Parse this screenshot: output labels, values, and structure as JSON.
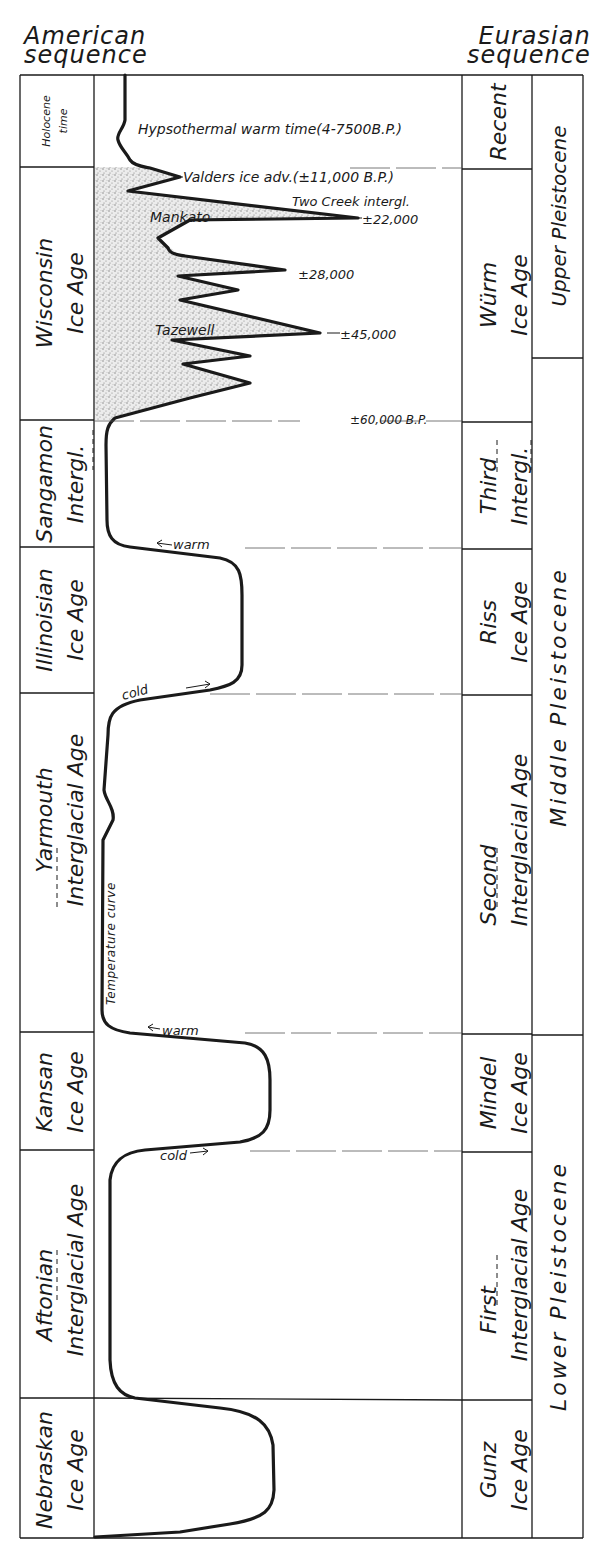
{
  "headers": {
    "american": [
      "American",
      "sequence"
    ],
    "eurasian": [
      "Eurasian",
      "sequence"
    ]
  },
  "american_sequence": [
    {
      "lines": [
        "Holocene",
        "time"
      ],
      "y_top": 75,
      "y_bottom": 167,
      "type": "holocene"
    },
    {
      "lines": [
        "Wisconsin",
        "Ice Age"
      ],
      "y_top": 167,
      "y_bottom": 420,
      "type": "glacial"
    },
    {
      "lines": [
        "Sangamon",
        "Intergl."
      ],
      "y_top": 420,
      "y_bottom": 547,
      "type": "interglacial"
    },
    {
      "lines": [
        "Illinoisian",
        "Ice Age"
      ],
      "y_top": 547,
      "y_bottom": 693,
      "type": "glacial"
    },
    {
      "lines": [
        "Yarmouth",
        "Interglacial Age"
      ],
      "y_top": 693,
      "y_bottom": 1032,
      "type": "interglacial"
    },
    {
      "lines": [
        "Kansan",
        "Ice Age"
      ],
      "y_top": 1032,
      "y_bottom": 1150,
      "type": "glacial"
    },
    {
      "lines": [
        "Aftonian",
        "Interglacial Age"
      ],
      "y_top": 1150,
      "y_bottom": 1398,
      "type": "interglacial"
    },
    {
      "lines": [
        "Nebraskan",
        "Ice Age"
      ],
      "y_top": 1398,
      "y_bottom": 1538,
      "type": "glacial"
    }
  ],
  "eurasian_sequence": [
    {
      "lines": [
        "Recent"
      ],
      "y_top": 75,
      "y_bottom": 169
    },
    {
      "lines": [
        "Würm",
        "Ice Age"
      ],
      "y_top": 169,
      "y_bottom": 422
    },
    {
      "lines": [
        "Third",
        "Intergl."
      ],
      "y_top": 422,
      "y_bottom": 549
    },
    {
      "lines": [
        "Riss",
        "Ice Age"
      ],
      "y_top": 549,
      "y_bottom": 695
    },
    {
      "lines": [
        "Second",
        "Interglacial Age"
      ],
      "y_top": 695,
      "y_bottom": 1034
    },
    {
      "lines": [
        "Mindel",
        "Ice Age"
      ],
      "y_top": 1034,
      "y_bottom": 1152
    },
    {
      "lines": [
        "First",
        "Interglacial Age"
      ],
      "y_top": 1152,
      "y_bottom": 1400
    },
    {
      "lines": [
        "Gunz",
        "Ice Age"
      ],
      "y_top": 1400,
      "y_bottom": 1538
    }
  ],
  "epochs": [
    {
      "label": "Upper Pleistocene",
      "y_top": 75,
      "y_bottom": 358
    },
    {
      "label": "Middle Pleistocene",
      "y_top": 358,
      "y_bottom": 1035
    },
    {
      "label": "Lower Pleistocene",
      "y_top": 1035,
      "y_bottom": 1538
    }
  ],
  "annotations": {
    "hypsothermal": "Hypsothermal warm time(4-7500B.P.)",
    "valders": "Valders ice adv.(±11,000 B.P.)",
    "two_creek": "Two Creek intergl.",
    "mankato": "Mankato",
    "date_22000": "±22,000",
    "date_28000": "±28,000",
    "tazewell": "Tazewell",
    "date_45000": "±45,000",
    "date_60000": "±60,000 B.P.",
    "warm_1": "warm",
    "cold_1": "cold",
    "temperature_curve": "Temperature    curve",
    "warm_2": "warm",
    "cold_2": "cold"
  },
  "colors": {
    "ink": "#1a1a1a",
    "stipple": "#9a9a9a",
    "background": "#ffffff"
  }
}
